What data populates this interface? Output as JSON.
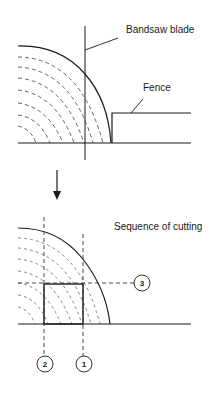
{
  "top_diagram": {
    "blade_label": "Bandsaw blade",
    "fence_label": "Fence"
  },
  "arrow": {
    "direction": "down",
    "icon": "arrow-down-icon"
  },
  "bottom_diagram": {
    "title": "Sequence of cutting",
    "cuts": [
      {
        "order": "1",
        "orientation": "vertical"
      },
      {
        "order": "2",
        "orientation": "vertical"
      },
      {
        "order": "3",
        "orientation": "horizontal"
      }
    ]
  },
  "colors": {
    "line": "#1a1a1a",
    "dashed": "#555555",
    "background": "#ffffff"
  }
}
